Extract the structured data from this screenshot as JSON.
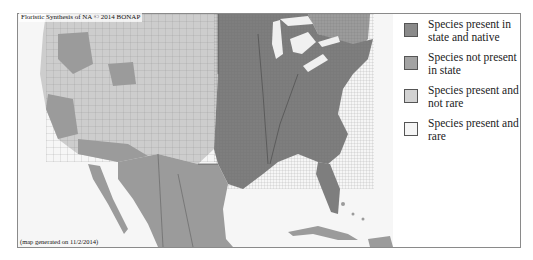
{
  "map": {
    "title": "Floristic Synthesis of NA © 2014 BONAP",
    "footer": "(map generated on 11/2/2014)",
    "colors": {
      "present_native": "#7e7e7e",
      "not_present": "#9b9b9b",
      "present_not_rare": "#cdcdcd",
      "present_rare": "#f3f3f3",
      "water": "#f6f6f6",
      "boundary": "#5a5a5a"
    }
  },
  "legend": {
    "items": [
      {
        "label": "Species present in state and native",
        "color": "#8a8a8a"
      },
      {
        "label": "Species not present in state",
        "color": "#a3a3a3"
      },
      {
        "label": "Species present and not rare",
        "color": "#d2d2d2"
      },
      {
        "label": "Species present and rare",
        "color": "#f5f5f5"
      }
    ]
  }
}
